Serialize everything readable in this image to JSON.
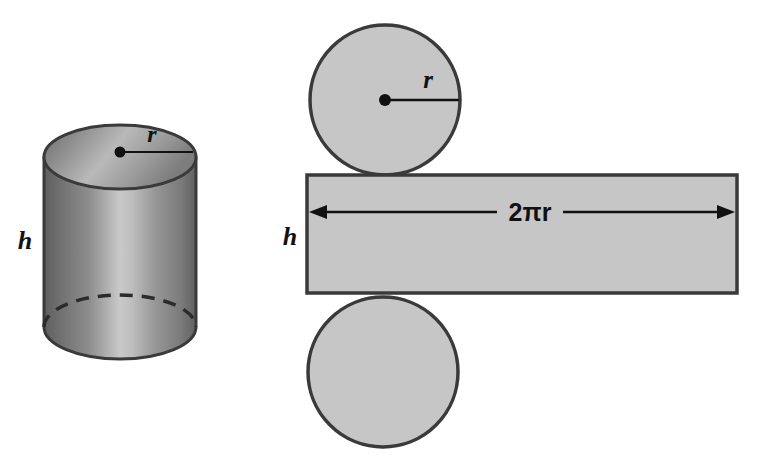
{
  "figure": {
    "canvas": {
      "width": 763,
      "height": 476,
      "background": "#ffffff"
    },
    "colors": {
      "flat_fill": "#c6c6c6",
      "outline": "#3a3a3a",
      "solid_dark": "#6e6e6e",
      "solid_light": "#cfcfcf",
      "label": "#111111"
    },
    "solid": {
      "name": "cylinder",
      "radius_label": "r",
      "height_label": "h",
      "has_hidden_dashed_edge": true
    },
    "net": {
      "name": "cylinder-net",
      "top_circle": {
        "label": "r",
        "radius_line": true
      },
      "bottom_circle": {
        "label": ""
      },
      "rectangle": {
        "width_label": "2πr",
        "height_label": "h",
        "dimension_arrow": "double-headed"
      }
    }
  }
}
